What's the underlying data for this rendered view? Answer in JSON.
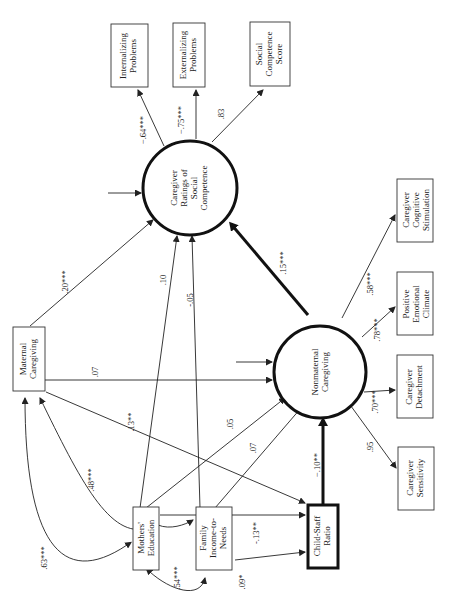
{
  "diagram": {
    "type": "structural-equation-path-diagram",
    "orientation": "rotated-90-counterclockwise",
    "nodes": {
      "internalizing": {
        "label": [
          "Internalizing",
          "Problems"
        ],
        "shape": "box"
      },
      "externalizing": {
        "label": [
          "Externalizing",
          "Problems"
        ],
        "shape": "box"
      },
      "social_competence_score": {
        "label": [
          "Social",
          "Competence",
          "Score"
        ],
        "shape": "box"
      },
      "caregiver_ratings": {
        "label": [
          "Caregiver",
          "Ratings of",
          "Social",
          "Competence"
        ],
        "shape": "circle"
      },
      "maternal_caregiving": {
        "label": [
          "Maternal",
          "Caregiving"
        ],
        "shape": "box"
      },
      "nonmaternal_caregiving": {
        "label": [
          "Nonmaternal",
          "Caregiving"
        ],
        "shape": "circle"
      },
      "cognitive_stimulation": {
        "label": [
          "Caregiver",
          "Cognitive",
          "Stimulation"
        ],
        "shape": "box"
      },
      "emotional_climate": {
        "label": [
          "Positive",
          "Emotional",
          "Climate"
        ],
        "shape": "box"
      },
      "detachment": {
        "label": [
          "Caregiver",
          "Detachment"
        ],
        "shape": "box"
      },
      "sensitivity": {
        "label": [
          "Caregiver",
          "Sensitivity"
        ],
        "shape": "box"
      },
      "mothers_education": {
        "label": [
          "Mothers'",
          "Education"
        ],
        "shape": "box"
      },
      "income_to_needs": {
        "label": [
          "Family",
          "Income-to-",
          "Needs"
        ],
        "shape": "box"
      },
      "child_staff_ratio": {
        "label": [
          "Child-Staff",
          "Ratio"
        ],
        "shape": "box-thick"
      }
    },
    "paths": {
      "ratings_to_internalizing": "−.64***",
      "ratings_to_externalizing": "−.75***",
      "ratings_to_score": ".83",
      "maternal_to_ratings": ".20***",
      "education_to_ratings": ".10",
      "income_to_ratings": "-.05",
      "nonmaternal_to_ratings": ".15***",
      "maternal_to_nonmaternal": ".07",
      "maternal_to_ratio": ".13**",
      "education_to_nonmaternal": ".05",
      "income_to_nonmaternal": ".07",
      "ratio_to_nonmaternal": "−.10**",
      "income_to_ratio": "-.13**",
      "nonmaternal_to_stimulation": ".58***",
      "nonmaternal_to_climate": ".78***",
      "nonmaternal_to_detachment": ".70***",
      "nonmaternal_to_sensitivity": ".95",
      "corr_maternal_education_a": ".63***",
      "corr_maternal_education_b": ".48***",
      "corr_education_income": ".54***",
      "ratio_error": ".09*"
    }
  }
}
